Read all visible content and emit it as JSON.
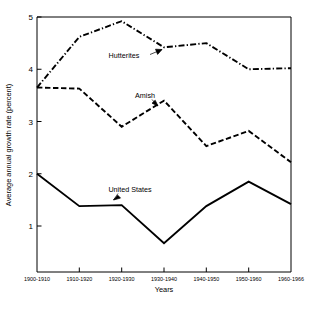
{
  "chart_data": {
    "type": "line",
    "title": "",
    "subtitle": "",
    "xlabel": "Years",
    "ylabel": "Average annual growth rate (percent)",
    "categories": [
      "1900-1910",
      "1910-1920",
      "1920-1930",
      "1930-1940",
      "1940-1950",
      "1950-1960",
      "1960-1966"
    ],
    "ylim": [
      0,
      5
    ],
    "yticks": [
      1,
      2,
      3,
      4,
      5
    ],
    "ytick_labels": [
      "1",
      "2",
      "3",
      "4",
      "5"
    ],
    "grid": false,
    "legend": "inline-annotations",
    "series": [
      {
        "name": "Hutterites",
        "style": "dash-dot",
        "color": "#000000",
        "values": [
          3.65,
          4.62,
          4.92,
          4.42,
          4.5,
          4.0,
          4.02
        ]
      },
      {
        "name": "Amish",
        "style": "dashed",
        "color": "#000000",
        "values": [
          3.65,
          3.63,
          2.9,
          3.4,
          2.53,
          2.82,
          2.22
        ]
      },
      {
        "name": "United States",
        "style": "solid",
        "color": "#000000",
        "values": [
          2.0,
          1.38,
          1.4,
          0.67,
          1.38,
          1.85,
          1.42
        ]
      }
    ],
    "annotations": [
      {
        "text": "Hutterites",
        "series": "Hutterites"
      },
      {
        "text": "Amish",
        "series": "Amish"
      },
      {
        "text": "United States",
        "series": "United States"
      }
    ]
  },
  "axes": {
    "y_title": "Average annual growth rate (percent)",
    "x_title": "Years",
    "y_tick_1": "1",
    "y_tick_2": "2",
    "y_tick_3": "3",
    "y_tick_4": "4",
    "y_tick_5": "5",
    "x_tick_0": "1900-1910",
    "x_tick_1": "1910-1920",
    "x_tick_2": "1920-1930",
    "x_tick_3": "1930-1940",
    "x_tick_4": "1940-1950",
    "x_tick_5": "1950-1960",
    "x_tick_6": "1960-1966"
  },
  "labels": {
    "hutterites": "Hutterites",
    "amish": "Amish",
    "united_states": "United States"
  }
}
